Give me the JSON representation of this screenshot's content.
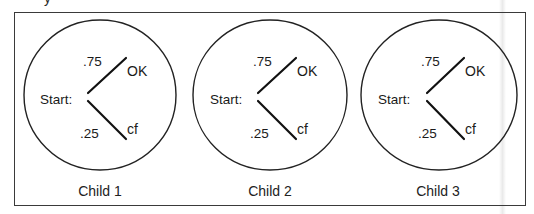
{
  "figure": {
    "top_partial_glyph": "y",
    "children": [
      {
        "label": "Child 1",
        "start_label": "Start:",
        "branches": [
          {
            "probability": ".75",
            "outcome": "OK"
          },
          {
            "probability": ".25",
            "outcome": "cf"
          }
        ]
      },
      {
        "label": "Child 2",
        "start_label": "Start:",
        "branches": [
          {
            "probability": ".75",
            "outcome": "OK"
          },
          {
            "probability": ".25",
            "outcome": "cf"
          }
        ]
      },
      {
        "label": "Child 3",
        "start_label": "Start:",
        "branches": [
          {
            "probability": ".75",
            "outcome": "OK"
          },
          {
            "probability": ".25",
            "outcome": "cf"
          }
        ]
      }
    ],
    "colors": {
      "stroke": "#222222",
      "frame": "#3a3a3a",
      "text": "#1a1a1a",
      "background": "#ffffff"
    }
  }
}
